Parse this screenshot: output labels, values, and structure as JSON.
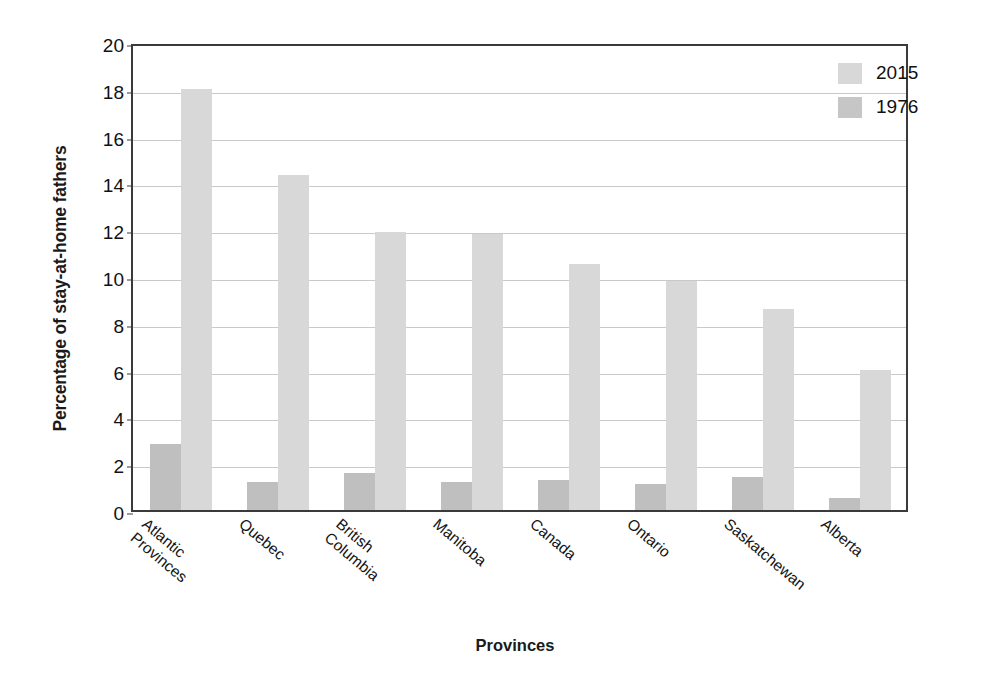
{
  "chart_data": {
    "type": "bar",
    "title": "",
    "xlabel": "Provinces",
    "ylabel": "Percentage of stay-at-home fathers",
    "categories": [
      "Atlantic\nProvinces",
      "Quebec",
      "British\nColumbia",
      "Manitoba",
      "Canada",
      "Ontario",
      "Saskatchewan",
      "Alberta"
    ],
    "series": [
      {
        "name": "1976",
        "color": "#bfbfbf",
        "values": [
          2.8,
          1.2,
          1.6,
          1.2,
          1.3,
          1.1,
          1.4,
          0.5
        ]
      },
      {
        "name": "2015",
        "color": "#d8d8d8",
        "values": [
          18.0,
          14.3,
          11.9,
          11.8,
          10.5,
          9.8,
          8.6,
          6.0
        ]
      }
    ],
    "ylim": [
      0,
      20
    ],
    "ytick_values": [
      0,
      2,
      4,
      6,
      8,
      10,
      12,
      14,
      16,
      18,
      20
    ],
    "ytick_labels": [
      "0",
      "2",
      "4",
      "6",
      "8",
      "10",
      "12",
      "14",
      "16",
      "18",
      "20"
    ],
    "grid": true,
    "legend_position": "top-right",
    "legend_order": [
      "2015",
      "1976"
    ]
  },
  "axis": {
    "y_title": "Percentage of stay-at-home fathers",
    "x_title": "Provinces"
  },
  "legend": {
    "entries": [
      {
        "label": "2015",
        "swatch": "#d8d8d8"
      },
      {
        "label": "1976",
        "swatch": "#c6c6c6"
      }
    ]
  }
}
